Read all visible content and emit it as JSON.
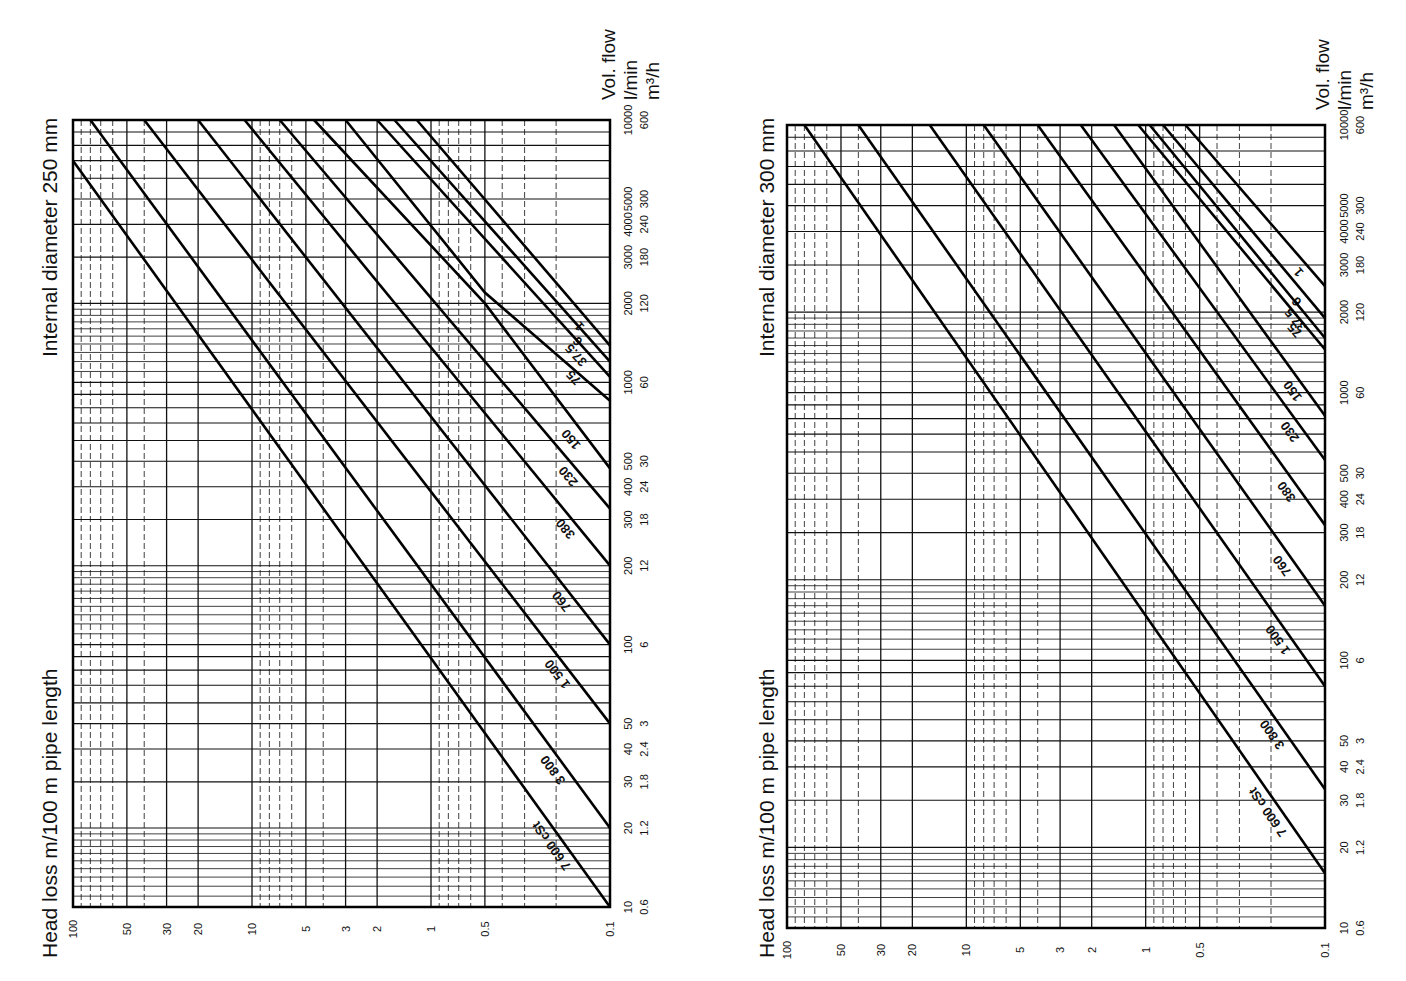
{
  "chart_data": [
    {
      "type": "line",
      "title": "Internal diameter 250 mm",
      "xlabel": "Head loss m/100 m pipe length",
      "ylabel": "Vol. flow",
      "ylabel_units": [
        "l/min",
        "m³/h"
      ],
      "x_scale": "log",
      "y_scale": "log",
      "xlim": [
        100,
        0.1
      ],
      "ylim": [
        10,
        10000
      ],
      "grid": true,
      "x_ticks": [
        "100",
        "50",
        "30",
        "20",
        "10",
        "5",
        "3",
        "2",
        "1",
        "0.5",
        "0.1"
      ],
      "y_ticks_lmin": [
        "10",
        "20",
        "30",
        "40",
        "50",
        "100",
        "200",
        "300",
        "400",
        "500",
        "1000",
        "2000",
        "3000",
        "4000",
        "5000",
        "10000"
      ],
      "y_ticks_m3h": [
        "0.6",
        "1.2",
        "1.8",
        "2.4",
        "3",
        "6",
        "12",
        "18",
        "24",
        "30",
        "60",
        "120",
        "180",
        "240",
        "300",
        "600"
      ],
      "series_unit": "cSt",
      "series": [
        {
          "name": "1",
          "points": [
            [
              0.1,
              1380
            ],
            [
              1.2,
              10000
            ]
          ]
        },
        {
          "name": "6",
          "points": [
            [
              0.1,
              1200
            ],
            [
              1.6,
              10000
            ]
          ]
        },
        {
          "name": "37.5",
          "points": [
            [
              0.1,
              1050
            ],
            [
              2.0,
              10000
            ]
          ]
        },
        {
          "name": "75",
          "points": [
            [
              0.1,
              850
            ],
            [
              0.5,
              2200
            ],
            [
              3.0,
              10000
            ]
          ]
        },
        {
          "name": "150",
          "points": [
            [
              0.1,
              470
            ],
            [
              0.5,
              2000
            ],
            [
              4.5,
              10000
            ]
          ]
        },
        {
          "name": "230",
          "points": [
            [
              0.1,
              330
            ],
            [
              7.0,
              10000
            ]
          ]
        },
        {
          "name": "380",
          "points": [
            [
              0.1,
              200
            ],
            [
              11.0,
              10000
            ]
          ]
        },
        {
          "name": "760",
          "points": [
            [
              0.1,
              100
            ],
            [
              20.0,
              10000
            ]
          ]
        },
        {
          "name": "1 500",
          "points": [
            [
              0.1,
              50
            ],
            [
              40.0,
              10000
            ]
          ]
        },
        {
          "name": "3 800",
          "points": [
            [
              0.1,
              20
            ],
            [
              80.0,
              10000
            ]
          ]
        },
        {
          "name": "7 600 cSt",
          "points": [
            [
              0.1,
              10
            ],
            [
              100.0,
              7000
            ]
          ]
        }
      ]
    },
    {
      "type": "line",
      "title": "Internal diameter 300 mm",
      "xlabel": "Head loss m/100 m pipe length",
      "ylabel": "Vol. flow",
      "ylabel_units": [
        "l/min",
        "m³/h"
      ],
      "x_scale": "log",
      "y_scale": "log",
      "xlim": [
        100,
        0.1
      ],
      "ylim": [
        10,
        10000
      ],
      "grid": true,
      "x_ticks": [
        "100",
        "50",
        "30",
        "20",
        "10",
        "5",
        "3",
        "2",
        "1",
        "0.5",
        "0.1"
      ],
      "y_ticks_lmin": [
        "10",
        "20",
        "30",
        "40",
        "50",
        "100",
        "200",
        "300",
        "400",
        "500",
        "1000",
        "2000",
        "3000",
        "4000",
        "5000",
        "10000"
      ],
      "y_ticks_m3h": [
        "0.6",
        "1.2",
        "1.8",
        "2.4",
        "3",
        "6",
        "12",
        "18",
        "24",
        "30",
        "60",
        "120",
        "180",
        "240",
        "300",
        "600"
      ],
      "series_unit": "cSt",
      "series": [
        {
          "name": "1",
          "points": [
            [
              0.1,
              2500
            ],
            [
              0.6,
              10000
            ]
          ]
        },
        {
          "name": "6",
          "points": [
            [
              0.1,
              1900
            ],
            [
              0.8,
              10000
            ]
          ]
        },
        {
          "name": "37.5",
          "points": [
            [
              0.1,
              1600
            ],
            [
              0.95,
              10000
            ]
          ]
        },
        {
          "name": "75",
          "points": [
            [
              0.1,
              1450
            ],
            [
              1.1,
              10000
            ]
          ]
        },
        {
          "name": "150",
          "points": [
            [
              0.1,
              820
            ],
            [
              1.5,
              10000
            ]
          ]
        },
        {
          "name": "230",
          "points": [
            [
              0.1,
              560
            ],
            [
              2.3,
              10000
            ]
          ]
        },
        {
          "name": "380",
          "points": [
            [
              0.1,
              320
            ],
            [
              4.0,
              10000
            ]
          ]
        },
        {
          "name": "760",
          "points": [
            [
              0.1,
              160
            ],
            [
              8.0,
              10000
            ]
          ]
        },
        {
          "name": "1 500",
          "points": [
            [
              0.1,
              80
            ],
            [
              16.0,
              10000
            ]
          ]
        },
        {
          "name": "3 800",
          "points": [
            [
              0.1,
              33
            ],
            [
              40.0,
              10000
            ]
          ]
        },
        {
          "name": "7 600 cSt",
          "points": [
            [
              0.1,
              16
            ],
            [
              80.0,
              10000
            ]
          ]
        }
      ]
    }
  ],
  "labels": {
    "left_title": "Internal diameter 250 mm",
    "right_title": "Internal diameter 300 mm",
    "left_xlabel": "Head loss m/100 m pipe length",
    "right_xlabel": "Head loss m/100 m pipe length",
    "vol_flow": "Vol. flow",
    "unit_lmin": "l/min",
    "unit_m3h": "m³/h"
  }
}
